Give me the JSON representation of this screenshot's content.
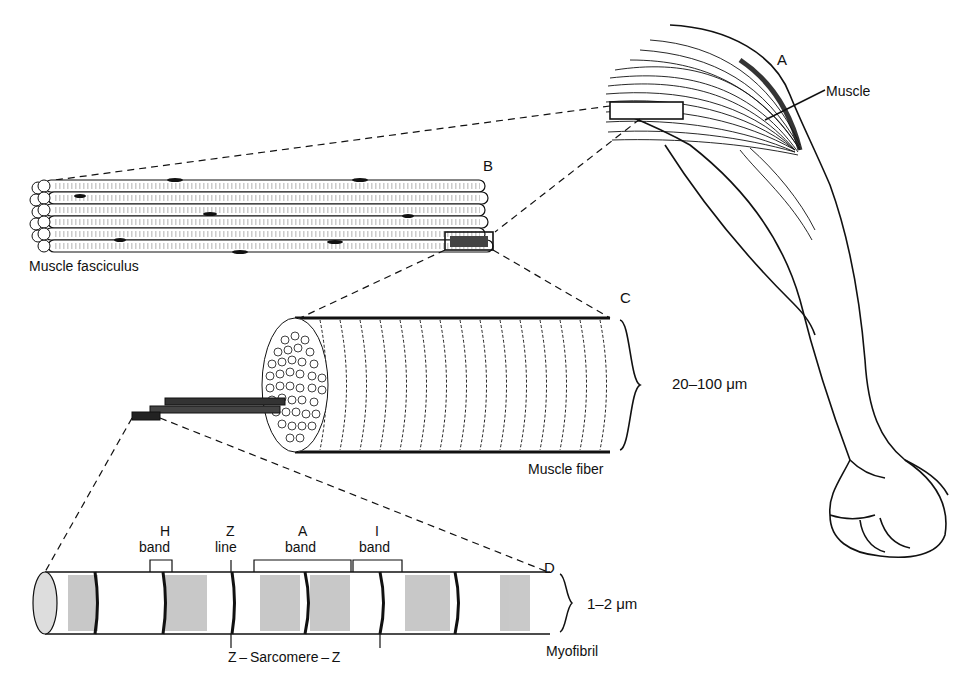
{
  "diagram": {
    "panels": {
      "A": {
        "letter": "A",
        "label": "Muscle"
      },
      "B": {
        "letter": "B",
        "label": "Muscle fasciculus"
      },
      "C": {
        "letter": "C",
        "label": "Muscle fiber",
        "size": "20–100 μm"
      },
      "D": {
        "letter": "D",
        "label": "Myofibril",
        "size": "1–2 μm"
      }
    },
    "bands": {
      "h_top": "H",
      "h_bottom": "band",
      "z_top": "Z",
      "z_bottom": "line",
      "a_top": "A",
      "a_bottom": "band",
      "i_top": "I",
      "i_bottom": "band"
    },
    "sarcomere": "Z – Sarcomere – Z",
    "colors": {
      "ink": "#111111",
      "background": "#ffffff",
      "shade": "#555555"
    }
  }
}
